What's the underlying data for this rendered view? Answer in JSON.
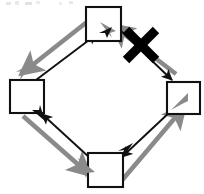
{
  "diagram": {
    "title": "Four-node cyclic diagram with one crossed-out edge",
    "type": "node-link-diagram",
    "canvas": {
      "width": 204,
      "height": 194,
      "background": "#ffffff"
    },
    "colors": {
      "node_stroke": "#111111",
      "node_fill": "#ffffff",
      "edge_black": "#111111",
      "edge_gray": "#8a8a8a",
      "cross_out": "#000000",
      "artifact_gray": "#d2d2d2"
    },
    "nodes": [
      {
        "id": "top",
        "name": "node-top",
        "label": "",
        "x": 86,
        "y": 7,
        "width": 35,
        "height": 34
      },
      {
        "id": "left",
        "name": "node-left",
        "label": "",
        "x": 10,
        "y": 80,
        "width": 34,
        "height": 33
      },
      {
        "id": "right",
        "name": "node-right",
        "label": "",
        "x": 167,
        "y": 82,
        "width": 33,
        "height": 32
      },
      {
        "id": "bottom",
        "name": "node-bottom",
        "label": "",
        "x": 88,
        "y": 153,
        "width": 35,
        "height": 34
      }
    ],
    "edges": [
      {
        "id": "e1",
        "name": "edge-left-to-top-black",
        "from": "left",
        "to": "top",
        "color": "black",
        "crossed_out": false
      },
      {
        "id": "e2",
        "name": "edge-top-to-left-gray",
        "from": "top",
        "to": "left",
        "color": "gray",
        "crossed_out": false
      },
      {
        "id": "e3",
        "name": "edge-top-to-right-black",
        "from": "top",
        "to": "right",
        "color": "black",
        "crossed_out": true
      },
      {
        "id": "e4",
        "name": "edge-right-to-top-gray",
        "from": "right",
        "to": "top",
        "color": "gray",
        "crossed_out": true
      },
      {
        "id": "e5",
        "name": "edge-right-to-bottom-black",
        "from": "right",
        "to": "bottom",
        "color": "black",
        "crossed_out": false
      },
      {
        "id": "e6",
        "name": "edge-bottom-to-right-gray",
        "from": "bottom",
        "to": "right",
        "color": "gray",
        "crossed_out": false
      },
      {
        "id": "e7",
        "name": "edge-bottom-to-left-black",
        "from": "bottom",
        "to": "left",
        "color": "black",
        "crossed_out": false
      },
      {
        "id": "e8",
        "name": "edge-left-to-bottom-gray",
        "from": "left",
        "to": "bottom",
        "color": "gray",
        "crossed_out": false
      }
    ],
    "annotations": [
      {
        "id": "x1",
        "name": "cross-out-x-mark",
        "symbol": "X",
        "cx": 141,
        "cy": 45,
        "size": 30,
        "stroke_width": 9
      }
    ]
  }
}
